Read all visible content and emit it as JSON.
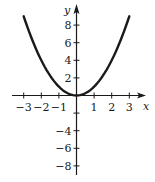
{
  "chart_data": {
    "type": "line",
    "title": "",
    "xlabel": "x",
    "ylabel": "y",
    "function": "y = x^2",
    "xlim": [
      -3.3,
      3.8
    ],
    "ylim": [
      -8.8,
      10
    ],
    "grid": false,
    "legend": null,
    "x_ticks": [
      -3,
      -2,
      -1,
      1,
      2,
      3
    ],
    "x_tick_labels": [
      "−3",
      "−2",
      "−1",
      "1",
      "2",
      "3"
    ],
    "y_ticks": [
      8,
      6,
      4,
      2,
      -2,
      -4,
      -6,
      -8
    ],
    "y_tick_labels": [
      "8",
      "6",
      "4",
      "2",
      "",
      "−4",
      "−6",
      "−8"
    ],
    "series": [
      {
        "name": "y = x^2",
        "x": [
          -3,
          -2.5,
          -2,
          -1.5,
          -1,
          -0.5,
          0,
          0.5,
          1,
          1.5,
          2,
          2.5,
          3
        ],
        "y": [
          9,
          6.25,
          4,
          2.25,
          1,
          0.25,
          0,
          0.25,
          1,
          2.25,
          4,
          6.25,
          9
        ]
      }
    ]
  },
  "axes": {
    "x_label": "x",
    "y_label": "y"
  },
  "colors": {
    "curve": "#1a1a1a",
    "axes": "#1a1a1a"
  }
}
